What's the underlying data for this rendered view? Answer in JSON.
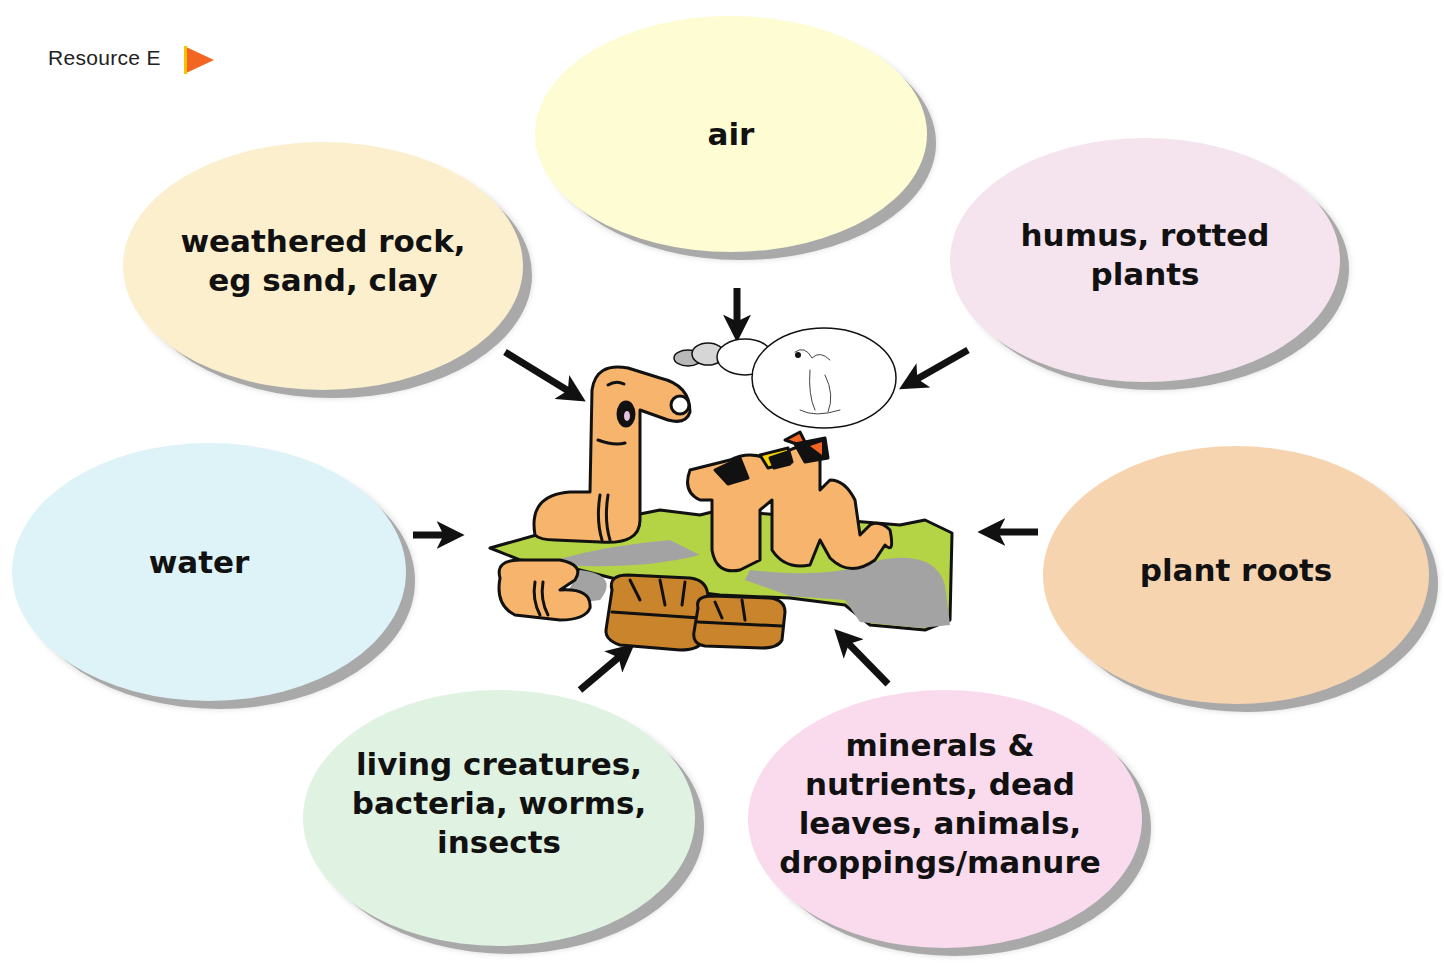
{
  "header": {
    "resource_label": "Resource E",
    "marker_icon": "play-triangle-icon",
    "marker_color": "#f26522"
  },
  "diagram": {
    "center_illustration": "cartoon worms having a picnic on soil with luggage, one thinking in a thought bubble",
    "bubbles": [
      {
        "id": "air",
        "label": "air",
        "lines": [
          "air"
        ],
        "color": "#fdfcd2"
      },
      {
        "id": "weathered-rock",
        "label": "weathered rock, eg sand, clay",
        "lines": [
          "weathered rock,",
          "eg sand, clay"
        ],
        "color": "#fbefcd"
      },
      {
        "id": "humus",
        "label": "humus, rotted plants",
        "lines": [
          "humus, rotted",
          "plants"
        ],
        "color": "#f5e4ee"
      },
      {
        "id": "water",
        "label": "water",
        "lines": [
          "water"
        ],
        "color": "#ddf3f7"
      },
      {
        "id": "plant-roots",
        "label": "plant roots",
        "lines": [
          "plant roots"
        ],
        "color": "#f7d4b0"
      },
      {
        "id": "living-creatures",
        "label": "living creatures, bacteria, worms, insects",
        "lines": [
          "living creatures,",
          "bacteria, worms,",
          "insects"
        ],
        "color": "#e0f2e1"
      },
      {
        "id": "minerals",
        "label": "minerals & nutrients, dead leaves, animals, droppings/manure",
        "lines": [
          "minerals &",
          "nutrients, dead",
          "leaves, animals,",
          "droppings/manure"
        ],
        "color": "#fadbee"
      }
    ],
    "arrows": [
      {
        "from": "air",
        "direction": "down"
      },
      {
        "from": "weathered-rock",
        "direction": "down-right"
      },
      {
        "from": "humus",
        "direction": "down-left"
      },
      {
        "from": "water",
        "direction": "right"
      },
      {
        "from": "plant-roots",
        "direction": "left"
      },
      {
        "from": "living-creatures",
        "direction": "up-right"
      },
      {
        "from": "minerals",
        "direction": "up-left"
      }
    ],
    "colors": {
      "worm": "#f6b46c",
      "grass": "#b5d445",
      "shadow": "#a3a3a3",
      "suitcase": "#c9842c",
      "outline": "#111111"
    }
  }
}
